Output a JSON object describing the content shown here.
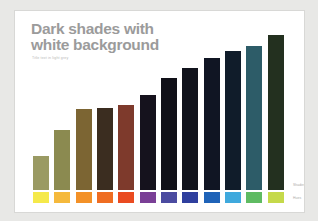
{
  "slide": {
    "title": "Dark shades with\nwhite background",
    "subtitle": "Title text in light grey",
    "title_color": "#9b9b9b",
    "background_color": "#ffffff",
    "canvas_color": "#e8e8e6"
  },
  "labels": {
    "shades": "Shades",
    "hues": "Hues"
  },
  "chart_data": {
    "type": "bar",
    "title": "Dark shades with white background",
    "subtitle": "Title text in light grey",
    "xlabel": "",
    "ylabel": "",
    "grid": false,
    "legend": "right",
    "ylim": [
      0,
      100
    ],
    "categories": [
      "Yellow",
      "Amber",
      "Orange",
      "Dark Orange",
      "Red Orange",
      "Purple",
      "Indigo",
      "Blue",
      "Bright Blue",
      "Cyan Blue",
      "Green",
      "Yellow Green"
    ],
    "values": [
      22,
      39,
      52,
      53,
      55,
      61,
      72,
      79,
      85,
      90,
      93,
      100
    ],
    "series": [
      {
        "name": "Shades",
        "values": [
          22,
          39,
          52,
          53,
          55,
          61,
          72,
          79,
          85,
          90,
          93,
          100
        ],
        "colors": [
          "#9a9a63",
          "#8b8a50",
          "#7c6533",
          "#3b2d20",
          "#7e3a2c",
          "#15121d",
          "#101018",
          "#11131c",
          "#101523",
          "#101c2a",
          "#2d5c68",
          "#23301f"
        ]
      },
      {
        "name": "Hues",
        "colors": [
          "#f5e94a",
          "#f5b93c",
          "#f39128",
          "#ef6d22",
          "#ea4b21",
          "#7a3f96",
          "#4b4ba0",
          "#2f3f9e",
          "#1f63b8",
          "#3fa9dd",
          "#5fbb62",
          "#c5d94a"
        ]
      }
    ]
  }
}
